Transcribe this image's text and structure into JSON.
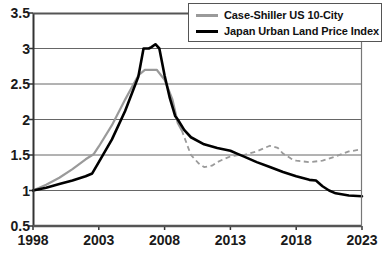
{
  "chart_data": {
    "type": "line",
    "title": "",
    "xlabel": "",
    "ylabel": "",
    "xlim": [
      1998,
      2023
    ],
    "ylim": [
      0.5,
      3.5
    ],
    "grid": true,
    "legend_position": "top-right",
    "y_ticks": [
      "3.5",
      "3",
      "2.5",
      "2",
      "1.5",
      "1",
      "0.5"
    ],
    "y_tick_values": [
      3.5,
      3,
      2.5,
      2,
      1.5,
      1,
      0.5
    ],
    "x_ticks": [
      "1998",
      "2003",
      "2008",
      "2013",
      "2018",
      "2023"
    ],
    "x_tick_values": [
      1998,
      2003,
      2008,
      2013,
      2018,
      2023
    ],
    "series": [
      {
        "name": "Case-Shiller US 10-City",
        "color": "#9a9a9a",
        "style": "solid-then-dashed",
        "dash_starts_at": 2009.3,
        "x": [
          1998,
          1999,
          2000,
          2001,
          2002,
          2002.6,
          2003,
          2004,
          2005,
          2006,
          2006.5,
          2007,
          2007.4,
          2008,
          2008.6,
          2009,
          2009.3,
          2010,
          2010.6,
          2011,
          2011.6,
          2012,
          2012.6,
          2013,
          2013.6,
          2014,
          2015,
          2015.6,
          2016,
          2016.6,
          2017,
          2017.6,
          2018,
          2019,
          2020,
          2021,
          2022,
          2023
        ],
        "y": [
          1.0,
          1.08,
          1.18,
          1.3,
          1.44,
          1.51,
          1.62,
          1.92,
          2.28,
          2.62,
          2.7,
          2.7,
          2.7,
          2.56,
          2.28,
          1.95,
          1.85,
          1.5,
          1.38,
          1.33,
          1.35,
          1.4,
          1.45,
          1.48,
          1.5,
          1.5,
          1.55,
          1.6,
          1.63,
          1.6,
          1.52,
          1.45,
          1.42,
          1.4,
          1.42,
          1.48,
          1.55,
          1.58
        ]
      },
      {
        "name": "Japan Urban Land Price Index",
        "color": "#000000",
        "style": "solid",
        "x": [
          1998,
          1999,
          2000,
          2001,
          2002,
          2002.5,
          2003,
          2004,
          2005,
          2006,
          2006.4,
          2006.8,
          2007,
          2007.3,
          2007.6,
          2008,
          2008.4,
          2008.8,
          2009,
          2009.5,
          2010,
          2011,
          2012,
          2013,
          2013.5,
          2014,
          2015,
          2016,
          2017,
          2018,
          2019,
          2019.5,
          2020,
          2020.5,
          2021,
          2022,
          2023
        ],
        "y": [
          1.0,
          1.04,
          1.09,
          1.14,
          1.2,
          1.24,
          1.4,
          1.72,
          2.12,
          2.6,
          3.0,
          3.0,
          3.02,
          3.06,
          3.0,
          2.62,
          2.3,
          2.05,
          2.0,
          1.85,
          1.75,
          1.65,
          1.6,
          1.56,
          1.52,
          1.48,
          1.4,
          1.33,
          1.26,
          1.2,
          1.15,
          1.14,
          1.06,
          1.0,
          0.96,
          0.93,
          0.92
        ]
      }
    ]
  },
  "legend": {
    "items": [
      {
        "label": "Case-Shiller US 10-City",
        "color": "#9a9a9a"
      },
      {
        "label": "Japan Urban Land Price Index",
        "color": "#000000"
      }
    ]
  },
  "axes": {
    "y_labels": [
      "3.5",
      "3",
      "2.5",
      "2",
      "1.5",
      "1",
      "0.5"
    ],
    "x_labels": [
      "1998",
      "2003",
      "2008",
      "2013",
      "2018",
      "2023"
    ]
  }
}
